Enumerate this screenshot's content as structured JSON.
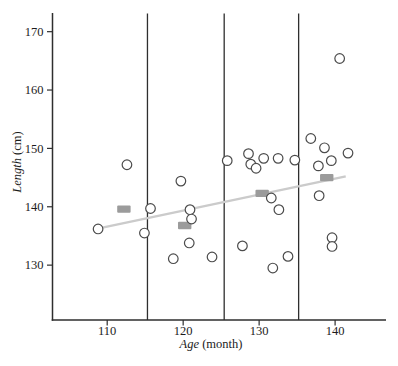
{
  "figure": {
    "background": "#ffffff"
  },
  "chart_data": {
    "type": "scatter",
    "title": "",
    "xlabel_italic": "Age",
    "xlabel_rest": " (month)",
    "ylabel_italic": "Length",
    "ylabel_rest": " (cm)",
    "x_ticks": [
      110,
      120,
      130,
      140
    ],
    "y_ticks": [
      130,
      140,
      150,
      160,
      170
    ],
    "xlim": [
      102.8,
      146.7
    ],
    "ylim": [
      120.6,
      173.2
    ],
    "grid": false,
    "legend": "none",
    "group_divider_x": [
      115.3,
      125.4,
      135.2
    ],
    "points": [
      [
        108.8,
        136.2
      ],
      [
        112.6,
        147.2
      ],
      [
        114.9,
        135.5
      ],
      [
        115.7,
        139.7
      ],
      [
        118.7,
        131.1
      ],
      [
        119.7,
        144.4
      ],
      [
        120.8,
        133.8
      ],
      [
        120.9,
        139.5
      ],
      [
        121.1,
        137.9
      ],
      [
        123.8,
        131.4
      ],
      [
        125.8,
        147.9
      ],
      [
        127.8,
        133.3
      ],
      [
        128.6,
        149.1
      ],
      [
        128.9,
        147.3
      ],
      [
        129.6,
        146.6
      ],
      [
        130.6,
        148.3
      ],
      [
        131.6,
        141.5
      ],
      [
        131.8,
        129.5
      ],
      [
        132.5,
        148.3
      ],
      [
        132.6,
        139.5
      ],
      [
        133.8,
        131.5
      ],
      [
        134.7,
        148.0
      ],
      [
        136.8,
        151.7
      ],
      [
        137.8,
        147.0
      ],
      [
        137.9,
        141.9
      ],
      [
        138.6,
        150.1
      ],
      [
        139.5,
        147.9
      ],
      [
        139.6,
        134.7
      ],
      [
        139.6,
        133.2
      ],
      [
        140.6,
        165.4
      ],
      [
        141.7,
        149.2
      ]
    ],
    "group_mean_squares": [
      [
        112.2,
        139.6
      ],
      [
        120.2,
        136.8
      ],
      [
        130.4,
        142.3
      ],
      [
        138.9,
        145.0
      ]
    ],
    "trend_line": {
      "x1": 108.9,
      "y1": 136.3,
      "x2": 141.4,
      "y2": 145.2
    },
    "colors": {
      "axis": "#2e2e2e",
      "point_stroke": "#4b4b4b",
      "point_fill": "#ffffff",
      "mean_square": "#9b9b9b",
      "trend_line": "#cbcbcb",
      "text": "#1c1c1c"
    }
  }
}
